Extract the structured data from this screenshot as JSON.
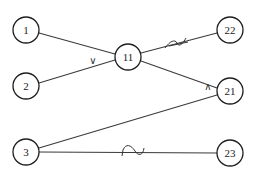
{
  "diagram": {
    "nodes": [
      {
        "id": "1",
        "label": "1",
        "x": 26,
        "y": 30
      },
      {
        "id": "2",
        "label": "2",
        "x": 26,
        "y": 86
      },
      {
        "id": "3",
        "label": "3",
        "x": 26,
        "y": 152
      },
      {
        "id": "11",
        "label": "11",
        "x": 128,
        "y": 57
      },
      {
        "id": "22",
        "label": "22",
        "x": 230,
        "y": 30
      },
      {
        "id": "21",
        "label": "21",
        "x": 230,
        "y": 91
      },
      {
        "id": "23",
        "label": "23",
        "x": 230,
        "y": 153
      }
    ],
    "edges": [
      {
        "from": "1",
        "to": "11",
        "mark": ""
      },
      {
        "from": "2",
        "to": "11",
        "mark": "∨"
      },
      {
        "from": "11",
        "to": "22",
        "mark": "sine-wave"
      },
      {
        "from": "11",
        "to": "21",
        "mark": "∧"
      },
      {
        "from": "3",
        "to": "21",
        "mark": ""
      },
      {
        "from": "3",
        "to": "23",
        "mark": "~"
      }
    ],
    "marks": {
      "or_symbol": "∨",
      "and_symbol": "∧"
    }
  }
}
